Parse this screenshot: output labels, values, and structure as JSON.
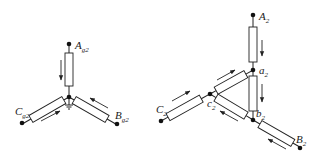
{
  "left_diagram": {
    "name": "grounded-star-network",
    "nodes": {
      "A": {
        "label": "A",
        "sub": "g2"
      },
      "B": {
        "label": "B",
        "sub": "g2"
      },
      "C": {
        "label": "C",
        "sub": "g2"
      }
    },
    "center_grounded": true,
    "current_arrows": [
      "A-to-center",
      "B-to-center",
      "C-to-center"
    ]
  },
  "right_diagram": {
    "name": "star-delta-network",
    "nodes": {
      "A": {
        "label": "A",
        "sub": "2"
      },
      "B": {
        "label": "B",
        "sub": "2"
      },
      "C": {
        "label": "C",
        "sub": "2"
      },
      "a": {
        "label": "a",
        "sub": "2"
      },
      "b": {
        "label": "b",
        "sub": "2"
      },
      "c": {
        "label": "c",
        "sub": "2"
      }
    },
    "current_arrows": [
      "A2-to-a2",
      "a2-to-b2",
      "C2-to-c2",
      "c2-to-a2",
      "b2-to-c2",
      "B2-to-b2"
    ]
  },
  "colors": {
    "line": "#222222",
    "background": "#ffffff"
  }
}
